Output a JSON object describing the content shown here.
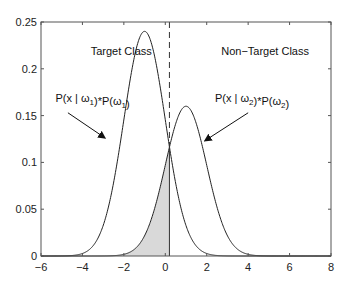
{
  "chart_data": {
    "type": "line",
    "title": "",
    "xlabel": "",
    "ylabel": "",
    "xlim": [
      -6,
      8
    ],
    "ylim": [
      0,
      0.25
    ],
    "grid": false,
    "xticks": [
      -6,
      -4,
      -2,
      0,
      2,
      4,
      6,
      8
    ],
    "xtick_labels": [
      "−6",
      "−4",
      "−2",
      "0",
      "2",
      "4",
      "6",
      "8"
    ],
    "yticks": [
      0,
      0.05,
      0.1,
      0.15,
      0.2,
      0.25
    ],
    "ytick_labels": [
      "0",
      "0.05",
      "0.1",
      "0.15",
      "0.2",
      "0.25"
    ],
    "series": [
      {
        "name": "P(x | ω1)*P(ω1)",
        "distribution": "gaussian",
        "mean": -1,
        "std": 1,
        "peak": 0.24
      },
      {
        "name": "P(x | ω2)*P(ω2)",
        "distribution": "gaussian",
        "mean": 1,
        "std": 1,
        "peak": 0.16
      }
    ],
    "threshold": {
      "x": 0.2,
      "style": "dashed"
    },
    "shaded_region": {
      "description": "Non-target curve area left of threshold",
      "x_from": -6,
      "x_to": 0.2,
      "color": "#d9d9d9"
    },
    "annotations": [
      {
        "text": "Target Class",
        "x": -3.6,
        "y": 0.215
      },
      {
        "text": "Non−Target Class",
        "x": 2.7,
        "y": 0.215
      },
      {
        "text_main": "P(x | ω",
        "sub1": "1",
        "mid": ")*P(ω",
        "sub2": "1",
        "end": ")",
        "x": -5.3,
        "y": 0.165
      },
      {
        "text_main": "P(x | ω",
        "sub1": "2",
        "mid": ")*P(ω",
        "sub2": "2",
        "end": ")",
        "x": 2.4,
        "y": 0.165
      }
    ],
    "arrows": [
      {
        "from": [
          -4.7,
          0.153
        ],
        "to": [
          -2.9,
          0.126
        ]
      },
      {
        "from": [
          4.0,
          0.153
        ],
        "to": [
          1.9,
          0.123
        ]
      }
    ]
  }
}
